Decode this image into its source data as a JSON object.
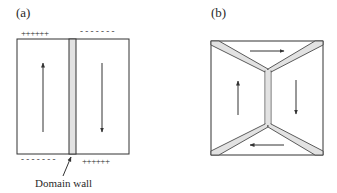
{
  "panel_a": {
    "label": "(a)",
    "top_left_charges": "++++++",
    "top_right_charges": "- - - - - - -",
    "bottom_left_charges": "- - - - - - -",
    "bottom_right_charges": "++++++",
    "wall_caption": "Domain wall",
    "left_domain_arrow": "up",
    "right_domain_arrow": "down"
  },
  "panel_b": {
    "label": "(b)",
    "top_domain_arrow": "right",
    "right_domain_arrow": "down",
    "bottom_domain_arrow": "left",
    "left_domain_arrow": "up"
  },
  "colors": {
    "line": "#333333",
    "wall_fill": "#e2e2e2"
  }
}
